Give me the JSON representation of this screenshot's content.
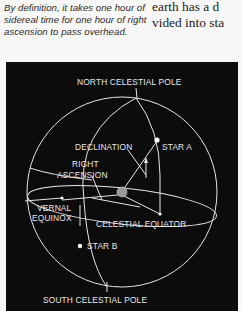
{
  "caption": {
    "text": "By definition, it takes one hour of sidereal time for one hour of right ascension to pass overhead."
  },
  "body_text": {
    "line1": "earth has a d",
    "line2": "vided into sta"
  },
  "diagram": {
    "background": "#0c0c0c",
    "line_color": "#e8e8e8",
    "labels": {
      "north_pole": "NORTH CELESTIAL POLE",
      "south_pole": "SOUTH CELESTIAL POLE",
      "declination": "DECLINATION",
      "star_a": "STAR A",
      "star_b": "STAR B",
      "right": "RIGHT",
      "ascension": "ASCENSION",
      "vernal": "VERNAL",
      "equinox": "EQUINOX",
      "celestial_equator": "CELESTIAL EQUATOR"
    }
  }
}
